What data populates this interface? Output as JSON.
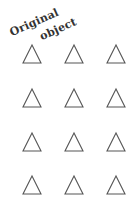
{
  "labels": {
    "line1": "Original",
    "line2": "object"
  },
  "shapes": {
    "type": "triangle-outline",
    "rows": 4,
    "cols": 3,
    "stroke": "#555555",
    "fill": "#ffffff"
  }
}
